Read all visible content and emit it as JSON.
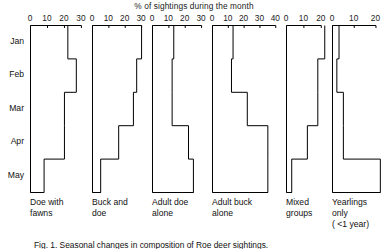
{
  "figure": {
    "title": "% of sightings during the month",
    "caption": "Fig. 1.  Seasonal changes in composition of Roe deer sightings.",
    "month_labels": [
      "Jan",
      "Feb",
      "Mar",
      "Apr",
      "May"
    ],
    "line_color": "#000000"
  },
  "chart_data": {
    "type": "bar",
    "title": "% of sightings during the month",
    "xlabel": "% of sightings during the month",
    "ylabel": "",
    "orientation": "horizontal-step",
    "categories": [
      "Jan",
      "Feb",
      "Mar",
      "Apr",
      "May"
    ],
    "grid": false,
    "legend": "none",
    "panels": [
      {
        "name": "doe-with-fawns",
        "label": "Doe with\nfawns",
        "label_line1": "Doe with",
        "label_line2": "fawns",
        "ticks": [
          0,
          10,
          20,
          30
        ],
        "xlim": [
          0,
          33
        ],
        "values": [
          22,
          27,
          20,
          20,
          8
        ]
      },
      {
        "name": "buck-and-doe",
        "label": "Buck and\ndoe",
        "label_line1": "Buck and",
        "label_line2": "doe",
        "ticks": [
          0,
          10,
          20,
          30
        ],
        "xlim": [
          0,
          33
        ],
        "values": [
          30,
          27,
          25,
          16,
          5
        ]
      },
      {
        "name": "adult-doe-alone",
        "label": "Adult doe\nalone",
        "label_line1": "Adult doe",
        "label_line2": "alone",
        "ticks": [
          0,
          10,
          20,
          30
        ],
        "xlim": [
          0,
          33
        ],
        "values": [
          13,
          12,
          12,
          22,
          25
        ]
      },
      {
        "name": "adult-buck-alone",
        "label": "Adult buck\nalone",
        "label_line1": "Adult buck",
        "label_line2": "alone",
        "ticks": [
          0,
          10,
          20,
          30,
          40
        ],
        "xlim": [
          0,
          43
        ],
        "values": [
          13,
          12,
          22,
          35,
          35
        ]
      },
      {
        "name": "mixed-groups",
        "label": "Mixed\ngroups",
        "label_line1": "Mixed",
        "label_line2": "groups",
        "ticks": [
          0,
          10,
          20
        ],
        "xlim": [
          0,
          23
        ],
        "values": [
          22,
          18,
          18,
          12,
          3
        ]
      },
      {
        "name": "yearlings-only",
        "label": "Yearlings\nonly\n( <1 year)",
        "label_line1": "Yearlings",
        "label_line2": "only",
        "label_line3": "( <1 year)",
        "ticks": [
          0,
          10,
          20
        ],
        "xlim": [
          0,
          23
        ],
        "values": [
          3,
          2,
          5,
          5,
          22
        ]
      }
    ]
  }
}
